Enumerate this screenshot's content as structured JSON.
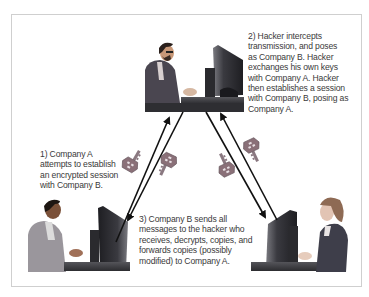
{
  "diagram": {
    "type": "man-in-the-middle-attack",
    "nodes": [
      {
        "id": "hacker",
        "label": "Hacker",
        "position": "top-center"
      },
      {
        "id": "company_a",
        "label": "Company A",
        "position": "bottom-left"
      },
      {
        "id": "company_b",
        "label": "Company B",
        "position": "bottom-right"
      }
    ],
    "edges": [
      {
        "from": "company_a",
        "to": "hacker",
        "style": "arrow"
      },
      {
        "from": "hacker",
        "to": "company_a",
        "style": "arrow"
      },
      {
        "from": "hacker",
        "to": "company_b",
        "style": "arrow"
      },
      {
        "from": "company_b",
        "to": "hacker",
        "style": "arrow"
      }
    ],
    "icons": [
      "key-icon",
      "key-icon",
      "key-icon",
      "key-icon"
    ]
  },
  "captions": {
    "step1": "1) Company A\nattempts to establish\nan encrypted session\nwith Company B.",
    "step2": "2) Hacker intercepts\ntransmission, and poses\nas Company B. Hacker\nexchanges his own keys\nwith Company A. Hacker\nthen establishes a session\nwith Company B, posing as\nCompany A.",
    "step3": "3) Company B sends all\nmessages to the hacker who\nreceives, decrypts, copies, and\nforwards copies (possibly\nmodified) to Company A."
  },
  "colors": {
    "frame_border": "#cfcfcf",
    "text": "#3a3a3a",
    "arrow": "#111111",
    "key": "#8a7078",
    "desk": "#3c3c40",
    "monitor": "#2a2a2e"
  }
}
